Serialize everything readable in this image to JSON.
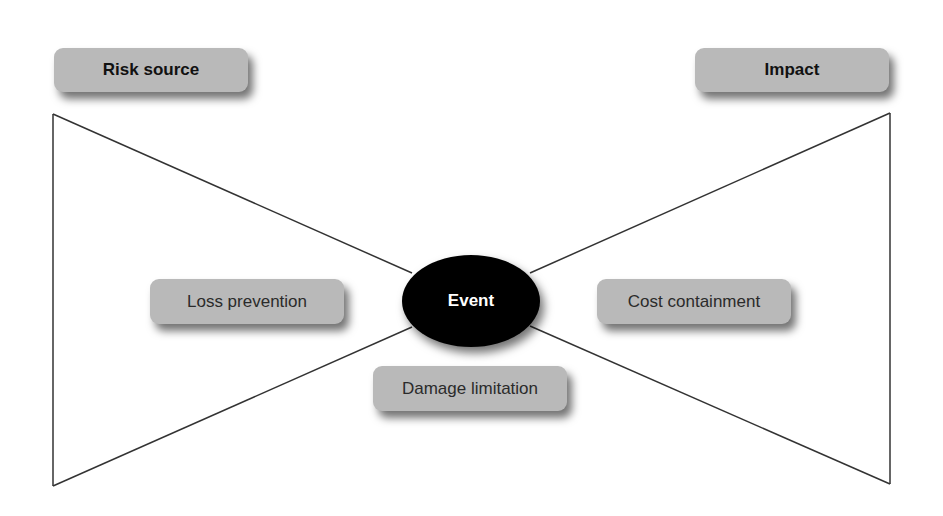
{
  "diagram": {
    "type": "bow-tie",
    "labels": {
      "risk_source": "Risk source",
      "impact": "Impact",
      "event": "Event",
      "loss_prevention": "Loss prevention",
      "cost_containment": "Cost containment",
      "damage_limitation": "Damage limitation"
    },
    "colors": {
      "box_fill": "#b9b9b9",
      "event_fill": "#000000",
      "event_text": "#ffffff",
      "line": "#333333"
    }
  }
}
